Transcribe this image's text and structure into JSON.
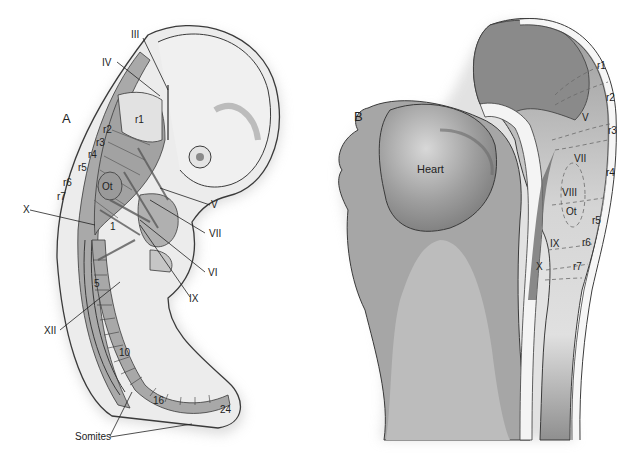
{
  "colors": {
    "background": "#ffffff",
    "tissue_light": "#e6e6e6",
    "tissue_mid": "#b9b9b9",
    "tissue_dark": "#8e8e8e",
    "outline": "#3a3a3a",
    "text": "#222222"
  },
  "panel_a": {
    "panel_label": "A",
    "rhombomeres": [
      "r1",
      "r2",
      "r3",
      "r4",
      "r5",
      "r6",
      "r7"
    ],
    "otic_label": "Ot",
    "cranial_nerves": [
      "III",
      "IV",
      "V",
      "VI",
      "VII",
      "IX",
      "X",
      "XII"
    ],
    "somite_numbers": [
      "1",
      "5",
      "10",
      "16",
      "24"
    ],
    "somites_label": "Somites"
  },
  "panel_b": {
    "panel_label": "B",
    "heart_label": "Heart",
    "rhombomeres": [
      "r1",
      "r2",
      "r3",
      "r4",
      "r5",
      "r6",
      "r7"
    ],
    "nerve_regions": [
      "V",
      "VII",
      "VIII",
      "IX",
      "X"
    ],
    "otic_label": "Ot"
  }
}
